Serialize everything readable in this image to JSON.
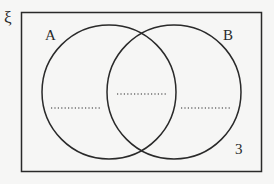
{
  "diagram": {
    "type": "venn",
    "universal_symbol": "ξ",
    "sets": [
      {
        "name": "A",
        "label": "A"
      },
      {
        "name": "B",
        "label": "B"
      }
    ],
    "regions": {
      "a_only": "......",
      "a_and_b": "......",
      "b_only": "......",
      "outside": "3"
    },
    "colors": {
      "stroke": "#2a2a2a",
      "background": "#f6f6f5"
    }
  }
}
